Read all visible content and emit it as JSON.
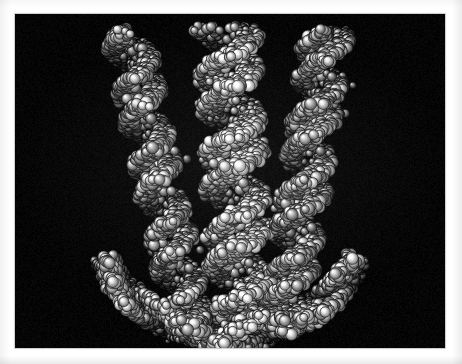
{
  "image": {
    "kind": "photograph",
    "subject": "space-filling molecular model of a DNA double helix",
    "orientation": "landscape",
    "width_px": 462,
    "height_px": 364,
    "border": {
      "style": "white photographic print border",
      "color": "#ffffff",
      "left_px": 15,
      "top_px": 14,
      "right_px": 17,
      "bottom_px": 16
    },
    "plate": {
      "background_color": "#050505",
      "x_px": 15,
      "y_px": 14,
      "width_px": 430,
      "height_px": 334
    }
  },
  "scene": {
    "background_color": "#050505",
    "model_color_light": "#e8e8e8",
    "model_color_mid": "#9a9a9a",
    "model_color_dark": "#3a3a3a",
    "outline_color": "#111111",
    "highlight_color": "#ffffff",
    "lighting": "single key light from upper-left, specular highlights on each sphere",
    "rendering": "CPK space-filling spheres, monochrome greyscale",
    "overall_shape": "U-shaped / horseshoe arc",
    "strand_count": 3,
    "approx_sphere_count": 2400,
    "sphere_radius_px": {
      "min": 3.4,
      "max": 5.6
    }
  },
  "strands": [
    {
      "name": "left-strand",
      "label": "Left helical strand",
      "top_x": 112,
      "bottom_x": 175,
      "top_y": 18,
      "bottom_y": 315,
      "helix_amplitude": 17,
      "helix_wavelength": 74,
      "phase": 0.15,
      "thickness": 26,
      "brightness": 0.88
    },
    {
      "name": "center-strand",
      "label": "Centre helical strand",
      "top_x": 212,
      "bottom_x": 228,
      "top_y": 14,
      "bottom_y": 330,
      "helix_amplitude": 22,
      "helix_wavelength": 80,
      "phase": 2.05,
      "thickness": 38,
      "brightness": 1.0
    },
    {
      "name": "right-strand",
      "label": "Right helical strand",
      "top_x": 312,
      "bottom_x": 268,
      "top_y": 18,
      "bottom_y": 318,
      "helix_amplitude": 18,
      "helix_wavelength": 76,
      "phase": 4.1,
      "thickness": 27,
      "brightness": 0.9
    }
  ],
  "bottom_arc": {
    "name": "bottom-junction-arc",
    "label": "Lower curved junction where the strands converge",
    "center_x": 215,
    "center_y": 214,
    "radius_x": 132,
    "radius_y": 104,
    "start_angle_deg": 18,
    "end_angle_deg": 162,
    "thickness": 32,
    "brightness": 0.95
  },
  "captions": {
    "alt_text": "Black and white photograph of a space-filling molecular model of DNA, three helical strands forming a U shape on a black background",
    "title": ""
  }
}
